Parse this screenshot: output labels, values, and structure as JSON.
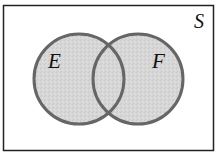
{
  "diagram": {
    "type": "venn",
    "universe": {
      "label": "S"
    },
    "sets": [
      {
        "label": "E",
        "shaded": true
      },
      {
        "label": "F",
        "shaded": true
      }
    ],
    "shaded_region": "E ∪ F",
    "colors": {
      "background": "#ffffff",
      "border": "#222222",
      "circle_stroke": "#666666",
      "circle_fill": "#d6d6d6",
      "text": "#111111"
    }
  }
}
